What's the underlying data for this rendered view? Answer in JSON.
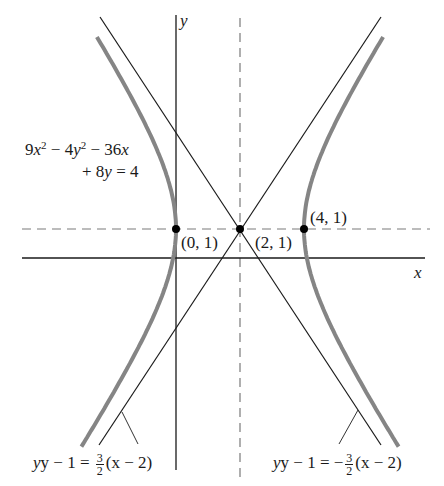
{
  "figure": {
    "equation": {
      "line1_parts": [
        "9",
        "x",
        "2",
        " − 4",
        "y",
        "2",
        " − 36",
        "x"
      ],
      "line2_parts": [
        "+ 8",
        "y",
        " = 4"
      ]
    },
    "axes": {
      "x_label": "x",
      "y_label": "y"
    },
    "points": [
      {
        "label": "(0, 1)",
        "x": 0,
        "y": 1
      },
      {
        "label": "(2, 1)",
        "x": 2,
        "y": 1
      },
      {
        "label": "(4, 1)",
        "x": 4,
        "y": 1
      }
    ],
    "asymptotes": [
      {
        "lhs": "y − 1 = ",
        "sign": "",
        "num": "3",
        "den": "2",
        "rhs": "(x − 2)"
      },
      {
        "lhs": "y − 1 = ",
        "sign": "−",
        "num": "3",
        "den": "2",
        "rhs": "(x − 2)"
      }
    ],
    "colors": {
      "hyperbola": "#808080",
      "lines": "#1a1a1a",
      "dashed": "#7a7a7a"
    }
  }
}
